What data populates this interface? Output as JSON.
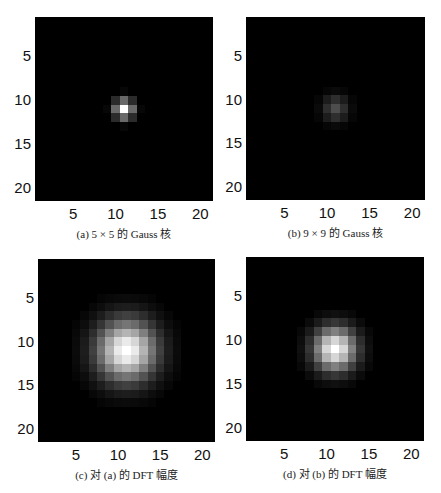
{
  "figure": {
    "panels": [
      {
        "id": "a",
        "caption": "(a) 5 × 5 的 Gauss 核",
        "left": 35,
        "top": 17,
        "width": 178,
        "height": 184,
        "sigma": 0.75,
        "peak": 1.0,
        "grid": 21,
        "center": [
          11,
          11
        ]
      },
      {
        "id": "b",
        "caption": "(b) 9 × 9 的 Gauss 核",
        "left": 246,
        "top": 17,
        "width": 179,
        "height": 183,
        "sigma": 1.0,
        "peak": 0.3,
        "grid": 21,
        "center": [
          11,
          11
        ]
      },
      {
        "id": "c",
        "caption": "(c) 对 (a) 的 DFT 幅度",
        "left": 38,
        "top": 259,
        "width": 177,
        "height": 183,
        "sigma": 2.4,
        "peak": 1.0,
        "grid": 21,
        "center": [
          11,
          11
        ]
      },
      {
        "id": "d",
        "caption": "(d) 对 (b) 的 DFT 幅度",
        "left": 246,
        "top": 257,
        "width": 178,
        "height": 184,
        "sigma": 1.7,
        "peak": 1.0,
        "grid": 21,
        "center": [
          11,
          11
        ]
      }
    ],
    "xticks": [
      "5",
      "10",
      "15",
      "20"
    ],
    "yticks": [
      "5",
      "10",
      "15",
      "20"
    ],
    "tick_values": [
      5,
      10,
      15,
      20
    ]
  },
  "chart_data": [
    {
      "type": "heatmap",
      "title": "(a) 5 × 5 的 Gauss 核",
      "xlabel": "",
      "ylabel": "",
      "x_range": [
        1,
        21
      ],
      "y_range": [
        1,
        21
      ],
      "xticks": [
        5,
        10,
        15,
        20
      ],
      "yticks": [
        5,
        10,
        15,
        20
      ],
      "colormap": "gray",
      "description": "5x5 Gaussian kernel zero-padded into 21x21 grid, bright peak at (11,11)"
    },
    {
      "type": "heatmap",
      "title": "(b) 9 × 9 的 Gauss 核",
      "xlabel": "",
      "ylabel": "",
      "x_range": [
        1,
        21
      ],
      "y_range": [
        1,
        21
      ],
      "xticks": [
        5,
        10,
        15,
        20
      ],
      "yticks": [
        5,
        10,
        15,
        20
      ],
      "colormap": "gray",
      "description": "9x9 Gaussian kernel zero-padded into 21x21 grid, dim spread peak at (11,11)"
    },
    {
      "type": "heatmap",
      "title": "(c) 对 (a) 的 DFT 幅度",
      "xlabel": "",
      "ylabel": "",
      "x_range": [
        1,
        21
      ],
      "y_range": [
        1,
        21
      ],
      "xticks": [
        5,
        10,
        15,
        20
      ],
      "yticks": [
        5,
        10,
        15,
        20
      ],
      "colormap": "gray",
      "description": "DFT magnitude of (a), broad Gaussian blob spanning approx rows/cols 6-16"
    },
    {
      "type": "heatmap",
      "title": "(d) 对 (b) 的 DFT 幅度",
      "xlabel": "",
      "ylabel": "",
      "x_range": [
        1,
        21
      ],
      "y_range": [
        1,
        21
      ],
      "xticks": [
        5,
        10,
        15,
        20
      ],
      "yticks": [
        5,
        10,
        15,
        20
      ],
      "colormap": "gray",
      "description": "DFT magnitude of (b), narrower Gaussian blob spanning approx rows/cols 7-14"
    }
  ]
}
